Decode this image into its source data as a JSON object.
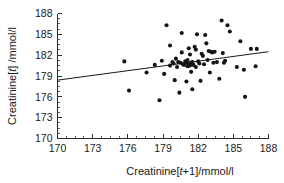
{
  "figure": {
    "background_color": "#ffffff",
    "marker_color": "#141414",
    "line_color": "#1a1a1a",
    "axis_color": "#2b2b2b"
  },
  "axis_titles": {
    "x_prefix": "Creatinine[",
    "x_italic": "t",
    "x_suffix": "+1]/mmol/l",
    "x_full": "Creatinine[t+1]/mmol/l",
    "y_prefix": "Creatinine[",
    "y_italic": "t",
    "y_suffix": "] /mmol/l",
    "y_full": "Creatinine[t] /mmol/l"
  },
  "chart_data": {
    "type": "scatter",
    "title": "",
    "xlabel": "Creatinine[t+1]/mmol/l",
    "ylabel": "Creatinine[t] /mmol/l",
    "xlim": [
      170,
      188
    ],
    "ylim": [
      170,
      188
    ],
    "xticks": [
      170,
      173,
      176,
      179,
      182,
      185,
      188
    ],
    "yticks": [
      170,
      173,
      176,
      179,
      182,
      185,
      188
    ],
    "xtick_labels": [
      "170",
      "173",
      "176",
      "179",
      "182",
      "185",
      "188"
    ],
    "ytick_labels": [
      "170",
      "173",
      "176",
      "179",
      "182",
      "185",
      "188"
    ],
    "minor_ticks_per_interval": 3,
    "grid": false,
    "legend": null,
    "marker": "filled-circle",
    "marker_size_px": 3.2,
    "points": [
      [
        175.7,
        181.1
      ],
      [
        176.1,
        176.9
      ],
      [
        177.6,
        179.5
      ],
      [
        178.3,
        180.6
      ],
      [
        178.7,
        175.5
      ],
      [
        178.9,
        181.2
      ],
      [
        179.1,
        179.3
      ],
      [
        179.3,
        186.3
      ],
      [
        179.6,
        183.4
      ],
      [
        179.6,
        180.5
      ],
      [
        179.8,
        181.0
      ],
      [
        179.9,
        180.8
      ],
      [
        180.0,
        178.4
      ],
      [
        180.1,
        181.5
      ],
      [
        180.2,
        180.3
      ],
      [
        180.3,
        181.0
      ],
      [
        180.4,
        176.6
      ],
      [
        180.5,
        180.9
      ],
      [
        180.6,
        185.2
      ],
      [
        180.6,
        182.4
      ],
      [
        180.7,
        180.7
      ],
      [
        180.8,
        180.6
      ],
      [
        180.9,
        181.1
      ],
      [
        181.0,
        180.9
      ],
      [
        181.0,
        178.2
      ],
      [
        181.1,
        181.3
      ],
      [
        181.1,
        180.4
      ],
      [
        181.2,
        180.8
      ],
      [
        181.2,
        183.0
      ],
      [
        181.3,
        180.5
      ],
      [
        181.3,
        182.1
      ],
      [
        181.4,
        180.9
      ],
      [
        181.4,
        179.6
      ],
      [
        181.5,
        181.0
      ],
      [
        181.5,
        177.1
      ],
      [
        181.6,
        180.6
      ],
      [
        181.7,
        183.2
      ],
      [
        181.8,
        182.8
      ],
      [
        181.8,
        180.3
      ],
      [
        181.9,
        185.0
      ],
      [
        182.0,
        181.1
      ],
      [
        182.1,
        180.8
      ],
      [
        182.2,
        178.3
      ],
      [
        182.3,
        182.2
      ],
      [
        182.4,
        181.9
      ],
      [
        182.5,
        180.7
      ],
      [
        182.6,
        184.9
      ],
      [
        182.7,
        183.7
      ],
      [
        182.8,
        181.3
      ],
      [
        182.9,
        182.6
      ],
      [
        183.0,
        179.5
      ],
      [
        183.1,
        182.5
      ],
      [
        183.2,
        182.4
      ],
      [
        183.3,
        180.9
      ],
      [
        183.4,
        182.5
      ],
      [
        183.6,
        181.0
      ],
      [
        183.8,
        178.6
      ],
      [
        184.0,
        187.0
      ],
      [
        184.1,
        182.3
      ],
      [
        184.2,
        180.9
      ],
      [
        184.3,
        181.2
      ],
      [
        184.5,
        186.3
      ],
      [
        184.7,
        185.4
      ],
      [
        185.3,
        180.3
      ],
      [
        185.6,
        184.0
      ],
      [
        185.9,
        179.9
      ],
      [
        186.0,
        176.0
      ],
      [
        186.5,
        182.9
      ],
      [
        186.9,
        180.4
      ],
      [
        187.0,
        182.9
      ]
    ],
    "fit_line": {
      "type": "linear-regression",
      "x_start": 170.0,
      "y_start": 178.4,
      "x_end": 188.0,
      "y_end": 182.5
    }
  }
}
